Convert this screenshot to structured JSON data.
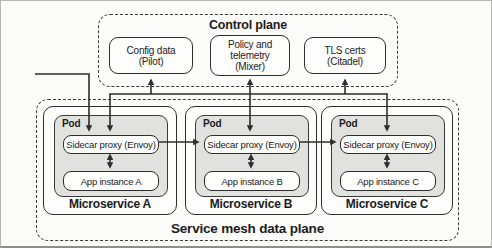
{
  "control_plane": {
    "title": "Control plane",
    "components": [
      {
        "id": "pilot",
        "lines": [
          "Config data",
          "(Pilot)"
        ]
      },
      {
        "id": "mixer",
        "lines": [
          "Policy and",
          "telemetry",
          "(Mixer)"
        ]
      },
      {
        "id": "citadel",
        "lines": [
          "TLS certs",
          "(Citadel)"
        ]
      }
    ]
  },
  "data_plane": {
    "title": "Service mesh data plane",
    "microservices": [
      {
        "name": "Microservice A",
        "pod_label": "Pod",
        "sidecar_label": "Sidecar proxy (Envoy)",
        "app_label": "App instance A"
      },
      {
        "name": "Microservice B",
        "pod_label": "Pod",
        "sidecar_label": "Sidecar proxy (Envoy)",
        "app_label": "App instance B"
      },
      {
        "name": "Microservice C",
        "pod_label": "Pod",
        "sidecar_label": "Sidecar proxy (Envoy)",
        "app_label": "App instance C"
      }
    ]
  },
  "colors": {
    "line": "#2e2e2e",
    "dashed_border": "#3a3a3a",
    "pod_fill": "#e1e1de",
    "box_fill": "#fdfdfc",
    "background": "#fbfbf9"
  }
}
